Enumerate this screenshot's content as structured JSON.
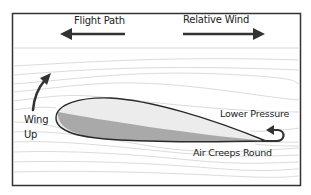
{
  "diagram": {
    "labels": {
      "flight_path": "Flight Path",
      "relative_wind": "Relative Wind",
      "wing_up_line1": "Wing",
      "wing_up_line2": "Up",
      "lower_pressure": "Lower Pressure",
      "air_creeps_round": "Air Creeps Round"
    },
    "arrows": {
      "flight_path": {
        "direction": "left",
        "icon": "arrow-left-icon"
      },
      "relative_wind": {
        "direction": "right",
        "icon": "arrow-right-icon"
      },
      "wing_up": {
        "direction": "up",
        "icon": "curved-arrow-up-icon"
      },
      "air_creeps_round": {
        "direction": "curl-back",
        "icon": "curl-arrow-icon"
      }
    },
    "colors": {
      "frame": "#333333",
      "streamline": "#cfcfcf",
      "airfoil_top": "#ececec",
      "airfoil_bottom": "#a9a9a9",
      "airfoil_outline": "#2a2a2a",
      "text": "#222222"
    }
  }
}
